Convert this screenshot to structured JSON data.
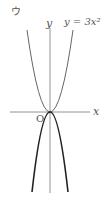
{
  "figure_label": "ウ",
  "y_axis_label": "y",
  "x_axis_label": "x",
  "origin_label": "O",
  "curve_label": "y = 3x²",
  "curves": [
    {
      "name": "y=3x^2",
      "style": "thin gray",
      "opens": "up"
    },
    {
      "name": "answer curve",
      "style": "thick black",
      "opens": "down"
    }
  ]
}
